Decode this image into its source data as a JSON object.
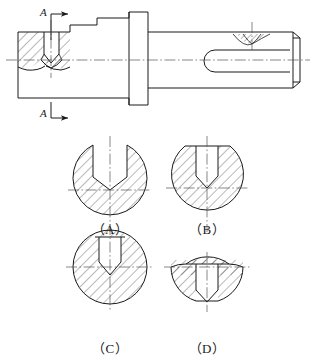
{
  "figure": {
    "type": "engineering-drawing",
    "section_marks": [
      {
        "label": "A",
        "position": "top-left",
        "arrow_direction": "right"
      },
      {
        "label": "A",
        "position": "bottom-left",
        "arrow_direction": "right"
      }
    ]
  },
  "main_view": {
    "name": "shaft-longitudinal-view",
    "features": [
      "left-end-sectioned-V-groove",
      "stepped-shoulder",
      "flange-collar",
      "keyway-slot",
      "conical-dimple",
      "chamfered-right-end"
    ]
  },
  "options": [
    {
      "id": "A",
      "label": "（A）",
      "shape": "circle-with-open-wide-slot",
      "slot_width_ratio": 0.42,
      "slot_reaches_centerline": true,
      "top_flat": false
    },
    {
      "id": "B",
      "label": "（B）",
      "shape": "circle-with-flat-top-narrow-slot",
      "slot_width_ratio": 0.26,
      "slot_reaches_centerline": true,
      "top_flat": true
    },
    {
      "id": "C",
      "label": "（C）",
      "shape": "full-circle-with-interior-narrow-slot",
      "slot_width_ratio": 0.26,
      "slot_reaches_centerline": true,
      "top_flat": false
    },
    {
      "id": "D",
      "label": "（D）",
      "shape": "circle-with-flat-top-and-bottom-narrow-slot",
      "slot_width_ratio": 0.26,
      "slot_reaches_centerline": true,
      "top_flat": true
    }
  ],
  "style": {
    "line_color": "#1a1a1a",
    "center_line_color": "#555555",
    "hatch_color": "#2b2b2b",
    "background": "#ffffff"
  }
}
